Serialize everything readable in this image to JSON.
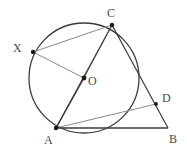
{
  "figure": {
    "type": "geometry-diagram",
    "colors": {
      "stroke_dark": "#3a3a3a",
      "stroke_light": "#8a8a8a",
      "label": "#4a4a4a",
      "background": "#ffffff",
      "point_fill": "#1a1a1a"
    },
    "circle": {
      "cx": 84,
      "cy": 78,
      "r": 55
    },
    "points": [
      {
        "id": "C",
        "label": "C",
        "x": 112,
        "y": 25,
        "label_x": 107,
        "label_y": 7,
        "marked": true
      },
      {
        "id": "X",
        "label": "X",
        "x": 33,
        "y": 52,
        "label_x": 13,
        "label_y": 42,
        "marked": true
      },
      {
        "id": "O",
        "label": "O",
        "x": 84,
        "y": 78,
        "label_x": 88,
        "label_y": 75,
        "marked": true
      },
      {
        "id": "D",
        "label": "D",
        "x": 156,
        "y": 104,
        "label_x": 162,
        "label_y": 92,
        "marked": true
      },
      {
        "id": "A",
        "label": "A",
        "x": 56,
        "y": 128,
        "label_x": 44,
        "label_y": 134,
        "marked": true
      },
      {
        "id": "B",
        "label": "B",
        "x": 168,
        "y": 128,
        "label_x": 169,
        "label_y": 133,
        "marked": false
      }
    ],
    "segments": [
      {
        "id": "XC",
        "from": "X",
        "to": "C",
        "shade": "light"
      },
      {
        "id": "XO",
        "from": "X",
        "to": "O",
        "shade": "light"
      },
      {
        "id": "OC",
        "from": "O",
        "to": "C",
        "shade": "light"
      },
      {
        "id": "OA",
        "from": "O",
        "to": "A",
        "shade": "dark"
      },
      {
        "id": "AC",
        "from": "A",
        "to": "C",
        "shade": "dark"
      },
      {
        "id": "CB",
        "from": "C",
        "to": "B",
        "shade": "dark"
      },
      {
        "id": "AD",
        "from": "A",
        "to": "D",
        "shade": "light"
      },
      {
        "id": "AB",
        "from": "A",
        "to": "B",
        "shade": "dark"
      }
    ]
  }
}
